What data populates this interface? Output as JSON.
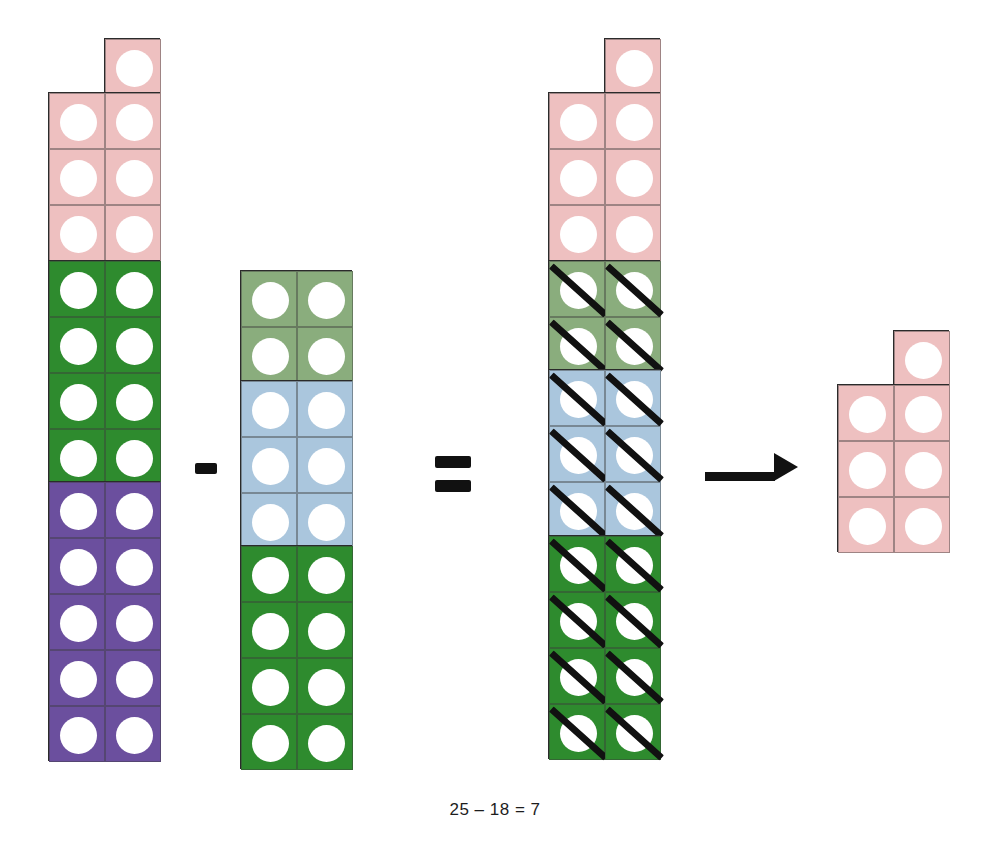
{
  "caption": "25 – 18 = 7",
  "equation": {
    "minuend": 25,
    "subtrahend": 18,
    "difference": 7,
    "minus_label": "-",
    "equals_label": "=",
    "arrow_label": "→"
  },
  "colors": {
    "pink": "#eec0c0",
    "dark_green": "#2e8b2e",
    "sage_green": "#8aad7d",
    "light_blue": "#aac6dd",
    "purple": "#6b4f9e",
    "outline": "#2b2b2b",
    "dot": "#ffffff",
    "ink": "#111111",
    "background": "#ffffff"
  },
  "towers": [
    {
      "id": "minuend-tower",
      "name": "minuend-tower",
      "total": 25,
      "has_notch": true,
      "notch_column": "right",
      "blocks": [
        {
          "name": "pink-block",
          "color": "#eec0c0",
          "rows": 4,
          "count": 7,
          "notched": true,
          "crossed": false
        },
        {
          "name": "green-block",
          "color": "#2e8b2e",
          "rows": 4,
          "count": 8,
          "notched": false,
          "crossed": false
        },
        {
          "name": "purple-block",
          "color": "#6b4f9e",
          "rows": 5,
          "count": 10,
          "notched": false,
          "crossed": false
        }
      ]
    },
    {
      "id": "subtrahend-tower",
      "name": "subtrahend-tower",
      "total": 18,
      "has_notch": false,
      "notch_column": "",
      "blocks": [
        {
          "name": "sage-green-block",
          "color": "#8aad7d",
          "rows": 2,
          "count": 4,
          "notched": false,
          "crossed": false
        },
        {
          "name": "light-blue-block",
          "color": "#aac6dd",
          "rows": 3,
          "count": 6,
          "notched": false,
          "crossed": false
        },
        {
          "name": "green-block",
          "color": "#2e8b2e",
          "rows": 4,
          "count": 8,
          "notched": false,
          "crossed": false
        }
      ]
    },
    {
      "id": "worked-tower",
      "name": "worked-tower",
      "total": 25,
      "has_notch": true,
      "notch_column": "right",
      "blocks": [
        {
          "name": "pink-block",
          "color": "#eec0c0",
          "rows": 4,
          "count": 7,
          "notched": true,
          "crossed": false
        },
        {
          "name": "sage-green-block",
          "color": "#8aad7d",
          "rows": 2,
          "count": 4,
          "notched": false,
          "crossed": true
        },
        {
          "name": "light-blue-block",
          "color": "#aac6dd",
          "rows": 3,
          "count": 6,
          "notched": false,
          "crossed": true
        },
        {
          "name": "green-block",
          "color": "#2e8b2e",
          "rows": 4,
          "count": 8,
          "notched": false,
          "crossed": true
        }
      ]
    },
    {
      "id": "difference-tower",
      "name": "difference-tower",
      "total": 7,
      "has_notch": true,
      "notch_column": "right",
      "blocks": [
        {
          "name": "pink-block",
          "color": "#eec0c0",
          "rows": 4,
          "count": 7,
          "notched": true,
          "crossed": false
        }
      ]
    }
  ],
  "layout": {
    "cell": 56,
    "towers": [
      {
        "ref": 0,
        "x": 48,
        "top": 38
      },
      {
        "ref": 1,
        "x": 240,
        "top": 270
      },
      {
        "ref": 2,
        "x": 548,
        "top": 38
      },
      {
        "ref": 3,
        "x": 837,
        "top": 330
      }
    ],
    "minus": {
      "x": 195,
      "y": 463,
      "w": 22,
      "h": 11
    },
    "equals": {
      "x": 435,
      "y": 456,
      "w": 36,
      "h": 12,
      "gap": 12
    },
    "arrow": {
      "x": 705,
      "y": 462,
      "shaft_w": 70,
      "shaft_h": 9
    },
    "caption": {
      "y": 800
    }
  }
}
